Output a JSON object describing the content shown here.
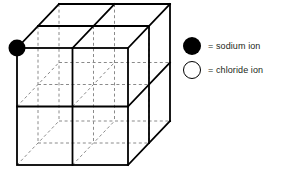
{
  "figure": {
    "type": "cube-lattice-diagram",
    "projection": "oblique",
    "divisions": 2,
    "line_color": "#000000",
    "hidden_line_color": "#808080",
    "background_color": "#ffffff",
    "cube": {
      "front_face": {
        "x": 17,
        "y": 48,
        "width": 111,
        "height": 117
      },
      "depth_offset": {
        "dx": 42,
        "dy": -44
      },
      "edge_width": 1.8,
      "hidden_edge_width": 1.0,
      "hidden_dash": "3,2.5"
    },
    "ions": [
      {
        "name": "sodium ion",
        "style": "filled",
        "color": "#000000",
        "position": {
          "x": 17,
          "y": 48
        },
        "radius": 8.5,
        "corner": "front-top-left"
      }
    ]
  },
  "legend": {
    "items": [
      {
        "marker": "filled-circle",
        "label": "= sodium ion",
        "color": "#000000"
      },
      {
        "marker": "open-circle",
        "label": "= chloride ion",
        "color": "#ffffff"
      }
    ]
  }
}
